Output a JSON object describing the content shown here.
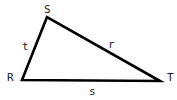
{
  "diagram": {
    "type": "triangle",
    "stroke_color": "#000000",
    "vertices": [
      {
        "name": "S",
        "label": "S",
        "x": 47,
        "y": 17,
        "lx": 44,
        "ly": 13
      },
      {
        "name": "R",
        "label": "R",
        "x": 22,
        "y": 80,
        "lx": 7,
        "ly": 81
      },
      {
        "name": "T",
        "label": "T",
        "x": 160,
        "y": 81,
        "lx": 167,
        "ly": 81
      }
    ],
    "sides": [
      {
        "name": "t",
        "label": "t",
        "from": "R",
        "to": "S",
        "lx": 23,
        "ly": 50
      },
      {
        "name": "r",
        "label": "r",
        "from": "S",
        "to": "T",
        "lx": 108,
        "ly": 48
      },
      {
        "name": "s",
        "label": "s",
        "from": "R",
        "to": "T",
        "lx": 89,
        "ly": 95
      }
    ]
  }
}
